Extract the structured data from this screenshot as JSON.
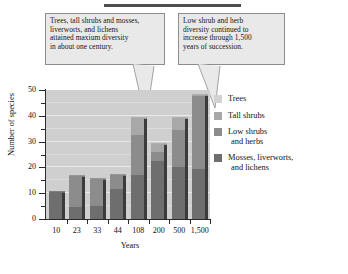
{
  "chart_data": {
    "type": "bar",
    "subtype": "stacked",
    "title": "",
    "xlabel": "Years",
    "ylabel": "Number of species",
    "ylim": [
      0,
      50
    ],
    "yticks": [
      0,
      10,
      20,
      30,
      40,
      50
    ],
    "ytick_labels": [
      "0",
      "10",
      "20",
      "30",
      "40",
      "50"
    ],
    "grid": true,
    "grid_axis": "y",
    "legend_position": "right",
    "categories": [
      "10",
      "23",
      "33",
      "44",
      "108",
      "200",
      "500",
      "1,500"
    ],
    "series": [
      {
        "name": "Mosses, liverworts, and lichens",
        "color": "#6e6e6e",
        "values": [
          10.5,
          4.5,
          5.0,
          11.5,
          17.0,
          22.5,
          20.0,
          19.5
        ]
      },
      {
        "name": "Low shrubs and herbs",
        "color": "#8c8c8c",
        "values": [
          0.0,
          12.0,
          10.5,
          5.5,
          15.5,
          3.5,
          14.5,
          28.0
        ]
      },
      {
        "name": "Tall shrubs",
        "color": "#a8a8a8",
        "values": [
          0.0,
          0.0,
          0.0,
          0.0,
          6.5,
          3.0,
          4.5,
          0.5
        ]
      },
      {
        "name": "Trees",
        "color": "#d2d2d2",
        "values": [
          0.0,
          0.0,
          0.0,
          0.0,
          0.0,
          0.0,
          0.0,
          0.0
        ]
      }
    ],
    "totals": [
      10.5,
      16.5,
      15.5,
      17.0,
      39.0,
      29.0,
      39.0,
      48.0
    ]
  },
  "axes": {
    "y_title": "Number of species",
    "x_title": "Years",
    "y_ticks": [
      "50",
      "40",
      "30",
      "20",
      "10",
      "0"
    ],
    "x_ticks": [
      "10",
      "23",
      "33",
      "44",
      "108",
      "200",
      "500",
      "1,500"
    ]
  },
  "legend": {
    "items": [
      {
        "label": "Trees",
        "label2": "",
        "color": "#d2d2d2"
      },
      {
        "label": "Tall shrubs",
        "label2": "",
        "color": "#a8a8a8"
      },
      {
        "label": "Low shrubs",
        "label2": "and herbs",
        "color": "#8c8c8c"
      },
      {
        "label": "Mosses, liverworts,",
        "label2": "and lichens",
        "color": "#6e6e6e"
      }
    ]
  },
  "callouts": {
    "left": {
      "line1": "Trees, tall shrubs and mosses,",
      "line2": "liverworts, and lichens",
      "line3": "attained maxium diversity",
      "line4": "in about one century."
    },
    "right": {
      "line1": "Low shrub and herb",
      "line2": "diversity continued to",
      "line3": "increase through 1,500",
      "line4": "years of succession."
    }
  },
  "colors": {
    "plot_background": "#cfcfcf",
    "gridline": "#e8e8e8",
    "axis": "#2a2a2a",
    "callout_fill": "#e9e9e9",
    "callout_border": "#8d8d8d"
  }
}
